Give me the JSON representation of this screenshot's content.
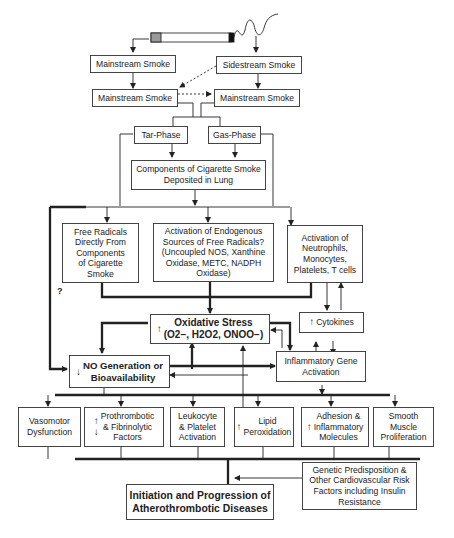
{
  "diagram": {
    "nodes": {
      "mainstream_top": "Mainstream Smoke",
      "sidestream": "Sidestream Smoke",
      "mainstream_mid_left": "Mainstream Smoke",
      "mainstream_mid_right": "Mainstream Smoke",
      "tar_phase": "Tar-Phase",
      "gas_phase": "Gas-Phase",
      "components": "Components of Cigarette Smoke\nDeposited in Lung",
      "free_radicals": "Free Radicals\nDirectly From\nComponents\nof Cigarette\nSmoke",
      "endogenous": "Activation of Endogenous\nSources of Free Radicals?\n(Uncoupled NOS, Xanthine\nOxidase, METC, NADPH\nOxidase)",
      "neutrophils": "Activation of\nNeutrophils,\nMonocytes,\nPlatelets, T cells",
      "oxidative_title": "Oxidative Stress",
      "oxidative_species": "(O2−, H2O2, ONOO−)",
      "cytokines": "Cytokines",
      "no_generation": "NO Generation or\nBioavailability",
      "inflammatory_gene": "Inflammatory Gene\nActivation",
      "vasomotor": "Vasomotor\nDysfunction",
      "prothrombotic": "Prothrombotic\n& Fibrinolytic\nFactors",
      "leukocyte": "Leukocyte\n& Platelet\nActivation",
      "lipid": "Lipid\nPeroxidation",
      "adhesion": "Adhesion &\nInflammatory\nMolecules",
      "smooth_muscle": "Smooth\nMuscle\nProliferation",
      "genetic": "Genetic Predisposition &\nOther Cardiovascular Risk\nFactors including Insulin\nResistance",
      "outcome": "Initiation and Progression of\nAtherothrombotic Diseases"
    },
    "annotations": {
      "question_mark": "?",
      "up_arrow": "↑",
      "down_arrow": "↓"
    },
    "colors": {
      "line": "#222222",
      "box_border": "#444444",
      "background": "#ffffff"
    }
  }
}
